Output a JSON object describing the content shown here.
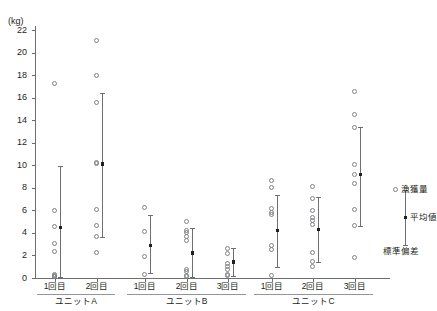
{
  "chart_data": {
    "type": "scatter",
    "title": "",
    "ylabel": "(kg)",
    "xlabel": "",
    "ylim": [
      0,
      22
    ],
    "ytick_labels": [
      "0",
      "2",
      "4",
      "6",
      "8",
      "10",
      "12",
      "14",
      "16",
      "18",
      "20",
      "22"
    ],
    "ytick_values": [
      0,
      2,
      4,
      6,
      8,
      10,
      12,
      14,
      16,
      18,
      20,
      22
    ],
    "grid": false,
    "legend_position": "right",
    "legend": [
      {
        "key": "catch",
        "label": "漁獲量",
        "marker": "open-circle"
      },
      {
        "key": "mean",
        "label": "平均値",
        "marker": "filled-square"
      },
      {
        "key": "sd",
        "label": "標準偏差",
        "marker": "error-bar"
      }
    ],
    "groups": [
      {
        "unit": "ユニットA",
        "trials": [
          {
            "label": "1回目",
            "values": [
              17.2,
              5.9,
              4.5,
              3.0,
              2.3,
              0.3,
              0.2,
              0.1,
              0.1
            ],
            "mean": 4.5,
            "sd_low": 0.1,
            "sd_high": 9.9
          },
          {
            "label": "2回目",
            "values": [
              21.0,
              17.9,
              15.5,
              10.2,
              10.1,
              6.0,
              4.6,
              3.6,
              2.2
            ],
            "mean": 10.1,
            "sd_low": 3.6,
            "sd_high": 16.4
          }
        ]
      },
      {
        "unit": "ユニットB",
        "trials": [
          {
            "label": "1回目",
            "values": [
              6.2,
              4.1,
              1.9,
              0.3
            ],
            "mean": 2.9,
            "sd_low": 0.4,
            "sd_high": 5.6
          },
          {
            "label": "2回目",
            "values": [
              5.0,
              4.2,
              4.0,
              3.6,
              3.3,
              0.7,
              0.5,
              0.2,
              0.1
            ],
            "mean": 2.2,
            "sd_low": 0.1,
            "sd_high": 4.4
          },
          {
            "label": "3回目",
            "values": [
              2.6,
              2.1,
              1.2,
              1.0,
              0.7,
              0.3,
              0.2
            ],
            "mean": 1.4,
            "sd_low": 0.2,
            "sd_high": 2.7
          }
        ]
      },
      {
        "unit": "ユニットC",
        "trials": [
          {
            "label": "1回目",
            "values": [
              8.6,
              8.0,
              6.1,
              5.8,
              5.6,
              2.8,
              2.5,
              0.2
            ],
            "mean": 4.2,
            "sd_low": 1.0,
            "sd_high": 7.4
          },
          {
            "label": "2回目",
            "values": [
              8.1,
              7.0,
              5.9,
              5.3,
              5.1,
              4.7,
              2.2,
              1.4,
              1.0
            ],
            "mean": 4.3,
            "sd_low": 1.4,
            "sd_high": 7.2
          },
          {
            "label": "3回目",
            "values": [
              16.5,
              14.5,
              13.3,
              10.0,
              9.1,
              8.3,
              6.0,
              4.6,
              1.8
            ],
            "mean": 9.2,
            "sd_low": 4.6,
            "sd_high": 13.4
          }
        ]
      }
    ]
  }
}
